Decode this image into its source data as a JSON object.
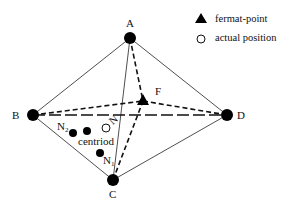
{
  "diagram": {
    "type": "network-geometry",
    "nodes": {
      "A": {
        "label": "A",
        "x": 130,
        "y": 38
      },
      "B": {
        "label": "B",
        "x": 33,
        "y": 115
      },
      "C": {
        "label": "C",
        "x": 113,
        "y": 180
      },
      "D": {
        "label": "D",
        "x": 227,
        "y": 115
      }
    },
    "fermat_point": {
      "label": "F",
      "x": 143,
      "y": 101
    },
    "actual_position": {
      "label": "N",
      "x": 106,
      "y": 127
    },
    "estimates": [
      {
        "label": "N",
        "sub": "2",
        "x": 73,
        "y": 133
      },
      {
        "label": "centriod",
        "x": 87,
        "y": 131
      },
      {
        "label": "N",
        "sub": "1",
        "x": 100,
        "y": 153
      }
    ],
    "edges_solid": [
      [
        "A",
        "B"
      ],
      [
        "A",
        "D"
      ],
      [
        "B",
        "C"
      ],
      [
        "C",
        "D"
      ],
      [
        "A",
        "C"
      ]
    ],
    "edges_dashed_to_fermat": [
      "A",
      "B",
      "C"
    ],
    "edges_long_dash": [
      [
        "B",
        "D"
      ]
    ],
    "colors": {
      "line": "#111111",
      "node": "#000000",
      "background": "#ffffff"
    }
  },
  "legend": {
    "items": [
      {
        "symbol": "filled-triangle",
        "label": "fermat-point"
      },
      {
        "symbol": "open-circle",
        "label": "actual position"
      }
    ]
  }
}
